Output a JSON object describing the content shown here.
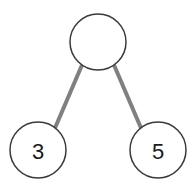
{
  "diagram": {
    "type": "tree",
    "background_color": "#ffffff",
    "node_fill_color": "#ffffff",
    "node_stroke_color": "#3a3a3a",
    "node_stroke_width": 1.5,
    "edge_color": "#808080",
    "edge_width": 4,
    "label_color": "#1a1a1a",
    "nodes": [
      {
        "id": "root",
        "label": "",
        "cx": 98,
        "cy": 42,
        "r": 28,
        "role": "root"
      },
      {
        "id": "left-leaf",
        "label": "3",
        "cx": 38,
        "cy": 150,
        "r": 28,
        "role": "leaf"
      },
      {
        "id": "right-leaf",
        "label": "5",
        "cx": 158,
        "cy": 150,
        "r": 28,
        "role": "leaf"
      }
    ],
    "edges": [
      {
        "id": "edge-root-left",
        "from": "root",
        "to": "left-leaf",
        "x1": 82,
        "y1": 65,
        "x2": 55,
        "y2": 128
      },
      {
        "id": "edge-root-right",
        "from": "root",
        "to": "right-leaf",
        "x1": 114,
        "y1": 65,
        "x2": 141,
        "y2": 128
      }
    ]
  }
}
